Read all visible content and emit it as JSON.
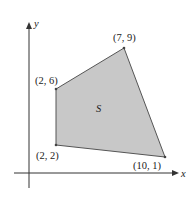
{
  "diagram": {
    "axes": {
      "x_label": "x",
      "y_label": "y"
    },
    "region": {
      "label": "S",
      "fill_color": "#c8c8c8",
      "edge_color": "#555555"
    },
    "vertices": [
      {
        "label": "(2, 6)",
        "x": 2,
        "y": 6
      },
      {
        "label": "(7, 9)",
        "x": 7,
        "y": 9
      },
      {
        "label": "(10, 1)",
        "x": 10,
        "y": 1
      },
      {
        "label": "(2, 2)",
        "x": 2,
        "y": 2
      }
    ]
  }
}
